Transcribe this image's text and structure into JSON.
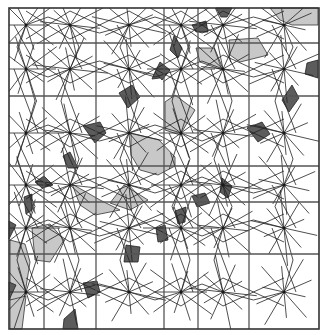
{
  "diagram": {
    "type": "geometric-tiling",
    "colors": {
      "background": "#ffffff",
      "line": "#222222",
      "grid_line": "#555555",
      "dark_tile": "#5c5c5c",
      "light_region": "#c8c8c8"
    },
    "frame": {
      "x": 9,
      "y": 8,
      "width": 310,
      "height": 321
    },
    "grid": {
      "vertical_x": [
        44,
        96,
        164,
        198,
        249
      ],
      "horizontal_y": [
        43,
        96,
        166,
        202,
        254
      ]
    },
    "star_centers": [
      [
        26,
        25
      ],
      [
        70,
        25
      ],
      [
        129,
        25
      ],
      [
        181,
        25
      ],
      [
        223,
        25
      ],
      [
        284,
        25
      ],
      [
        26,
        69
      ],
      [
        70,
        69
      ],
      [
        129,
        69
      ],
      [
        181,
        69
      ],
      [
        223,
        69
      ],
      [
        284,
        69
      ],
      [
        26,
        133
      ],
      [
        70,
        133
      ],
      [
        129,
        133
      ],
      [
        181,
        133
      ],
      [
        223,
        133
      ],
      [
        284,
        133
      ],
      [
        26,
        185
      ],
      [
        70,
        185
      ],
      [
        129,
        185
      ],
      [
        181,
        185
      ],
      [
        223,
        185
      ],
      [
        284,
        185
      ],
      [
        26,
        228
      ],
      [
        70,
        228
      ],
      [
        129,
        228
      ],
      [
        181,
        228
      ],
      [
        223,
        228
      ],
      [
        284,
        228
      ],
      [
        26,
        292
      ],
      [
        70,
        292
      ],
      [
        129,
        292
      ],
      [
        181,
        292
      ],
      [
        223,
        292
      ],
      [
        284,
        292
      ]
    ],
    "dark_rhombi": [
      [
        [
          155,
          72
        ],
        [
          162,
          66
        ],
        [
          160,
          78
        ],
        [
          152,
          79
        ]
      ],
      [
        [
          119,
          93
        ],
        [
          132,
          85
        ],
        [
          140,
          97
        ],
        [
          128,
          108
        ]
      ],
      [
        [
          83,
          126
        ],
        [
          100,
          122
        ],
        [
          106,
          133
        ],
        [
          95,
          143
        ]
      ],
      [
        [
          63,
          156
        ],
        [
          70,
          152
        ],
        [
          78,
          168
        ],
        [
          68,
          168
        ]
      ],
      [
        [
          216,
          8
        ],
        [
          232,
          8
        ],
        [
          227,
          17
        ],
        [
          221,
          17
        ]
      ],
      [
        [
          192,
          25
        ],
        [
          206,
          21
        ],
        [
          208,
          32
        ],
        [
          196,
          32
        ]
      ],
      [
        [
          174,
          36
        ],
        [
          182,
          48
        ],
        [
          178,
          58
        ],
        [
          170,
          50
        ]
      ],
      [
        [
          160,
          62
        ],
        [
          170,
          70
        ],
        [
          162,
          80
        ],
        [
          155,
          72
        ]
      ],
      [
        [
          292,
          85
        ],
        [
          299,
          98
        ],
        [
          289,
          112
        ],
        [
          282,
          100
        ]
      ],
      [
        [
          247,
          128
        ],
        [
          262,
          122
        ],
        [
          270,
          134
        ],
        [
          258,
          142
        ]
      ],
      [
        [
          307,
          63
        ],
        [
          318,
          60
        ],
        [
          318,
          78
        ],
        [
          305,
          74
        ]
      ],
      [
        [
          35,
          182
        ],
        [
          44,
          176
        ],
        [
          53,
          185
        ],
        [
          42,
          188
        ]
      ],
      [
        [
          24,
          197
        ],
        [
          32,
          194
        ],
        [
          32,
          210
        ],
        [
          26,
          214
        ]
      ],
      [
        [
          9,
          221
        ],
        [
          16,
          225
        ],
        [
          9,
          239
        ]
      ],
      [
        [
          192,
          196
        ],
        [
          205,
          193
        ],
        [
          210,
          203
        ],
        [
          197,
          207
        ]
      ],
      [
        [
          175,
          211
        ],
        [
          186,
          207
        ],
        [
          185,
          222
        ],
        [
          178,
          224
        ]
      ],
      [
        [
          156,
          228
        ],
        [
          165,
          225
        ],
        [
          168,
          240
        ],
        [
          158,
          242
        ]
      ],
      [
        [
          222,
          178
        ],
        [
          232,
          186
        ],
        [
          228,
          198
        ],
        [
          220,
          192
        ]
      ],
      [
        [
          126,
          245
        ],
        [
          140,
          247
        ],
        [
          138,
          262
        ],
        [
          124,
          262
        ]
      ],
      [
        [
          83,
          283
        ],
        [
          97,
          281
        ],
        [
          100,
          292
        ],
        [
          88,
          298
        ]
      ],
      [
        [
          9,
          282
        ],
        [
          16,
          285
        ],
        [
          9,
          300
        ]
      ],
      [
        [
          64,
          319
        ],
        [
          75,
          309
        ],
        [
          78,
          329
        ],
        [
          63,
          329
        ]
      ]
    ],
    "light_regions": [
      [
        [
          131,
          133
        ],
        [
          159,
          140
        ],
        [
          175,
          157
        ],
        [
          175,
          166
        ],
        [
          158,
          175
        ],
        [
          140,
          170
        ],
        [
          131,
          155
        ]
      ],
      [
        [
          165,
          102
        ],
        [
          175,
          95
        ],
        [
          195,
          110
        ],
        [
          180,
          135
        ],
        [
          165,
          130
        ]
      ],
      [
        [
          229,
          40
        ],
        [
          258,
          38
        ],
        [
          268,
          55
        ],
        [
          240,
          62
        ],
        [
          230,
          55
        ]
      ],
      [
        [
          270,
          8
        ],
        [
          318,
          8
        ],
        [
          318,
          25
        ],
        [
          292,
          25
        ],
        [
          280,
          20
        ]
      ],
      [
        [
          196,
          48
        ],
        [
          214,
          48
        ],
        [
          222,
          70
        ],
        [
          200,
          62
        ]
      ],
      [
        [
          72,
          184
        ],
        [
          100,
          200
        ],
        [
          120,
          210
        ],
        [
          95,
          215
        ],
        [
          80,
          205
        ]
      ],
      [
        [
          32,
          228
        ],
        [
          50,
          224
        ],
        [
          64,
          240
        ],
        [
          50,
          262
        ],
        [
          35,
          260
        ]
      ],
      [
        [
          10,
          240
        ],
        [
          25,
          244
        ],
        [
          30,
          262
        ],
        [
          24,
          300
        ],
        [
          10,
          300
        ]
      ],
      [
        [
          10,
          300
        ],
        [
          26,
          296
        ],
        [
          22,
          329
        ],
        [
          10,
          329
        ]
      ],
      [
        [
          124,
          185
        ],
        [
          148,
          200
        ],
        [
          130,
          210
        ],
        [
          110,
          203
        ]
      ]
    ]
  }
}
